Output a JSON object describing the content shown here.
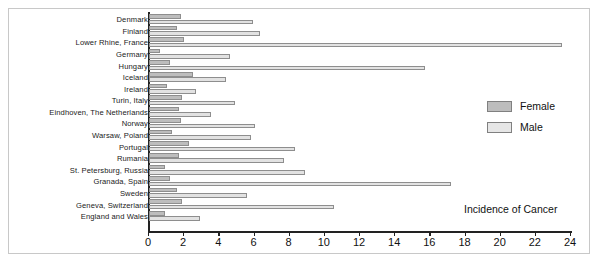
{
  "chart_data": {
    "type": "bar",
    "orientation": "horizontal",
    "title": "",
    "xlabel": "Incidence of Cancer",
    "ylabel": "",
    "xlim": [
      0,
      24
    ],
    "xticks": [
      0,
      2,
      4,
      6,
      8,
      10,
      12,
      14,
      16,
      18,
      20,
      22,
      24
    ],
    "grid": false,
    "legend_position": "right",
    "categories": [
      "Denmark",
      "Finland",
      "Lower Rhine, France",
      "Germany",
      "Hungary",
      "Iceland",
      "Ireland",
      "Turin, Italy",
      "Eindhoven, The Netherlands",
      "Norway",
      "Warsaw, Poland",
      "Portugal",
      "Rumania",
      "St. Petersburg, Russia",
      "Granada, Spain",
      "Sweden",
      "Geneva, Switzerland",
      "England and Wales"
    ],
    "series": [
      {
        "name": "Female",
        "color": "#bdbdbd",
        "values": [
          1.8,
          1.6,
          2.0,
          0.6,
          1.2,
          2.5,
          1.0,
          1.9,
          1.7,
          1.8,
          1.3,
          2.3,
          1.7,
          0.9,
          1.2,
          1.6,
          1.9,
          0.9
        ]
      },
      {
        "name": "Male",
        "color": "#e2e2e2",
        "values": [
          5.9,
          6.3,
          23.5,
          4.6,
          15.7,
          4.4,
          2.7,
          4.9,
          3.5,
          6.0,
          5.8,
          8.3,
          7.7,
          8.9,
          17.2,
          5.6,
          10.5,
          2.9
        ]
      }
    ]
  },
  "legend": {
    "items": [
      {
        "label": "Female"
      },
      {
        "label": "Male"
      }
    ]
  },
  "axis": {
    "title": "Incidence of Cancer",
    "tick_labels": [
      "0",
      "2",
      "4",
      "6",
      "8",
      "10",
      "12",
      "14",
      "16",
      "18",
      "20",
      "22",
      "24"
    ]
  },
  "colors": {
    "female": "#bdbdbd",
    "male": "#e2e2e2",
    "bar_border": "#8e8e8e",
    "axis": "#222222",
    "frame": "#c8c8c8",
    "background": "#ffffff"
  }
}
